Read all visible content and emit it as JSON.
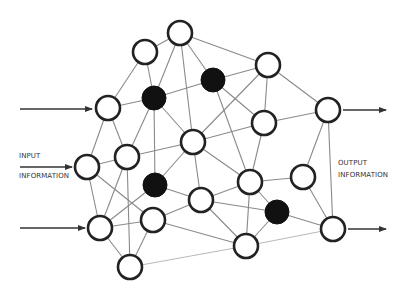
{
  "diagram": {
    "labels": {
      "input_line1": "INPUT",
      "input_line2": "INFORMATION",
      "output_line1": "OUTPUT",
      "output_line2": "INFORMATION"
    },
    "colors": {
      "node_fill_white": "#ffffff",
      "node_fill_black": "#111111",
      "node_stroke": "#222222",
      "edge": "#8a8a8a",
      "arrow": "#333333"
    },
    "nodes": [
      {
        "id": "A",
        "x": 145,
        "y": 52,
        "type": "white"
      },
      {
        "id": "B",
        "x": 180,
        "y": 33,
        "type": "white"
      },
      {
        "id": "C",
        "x": 213,
        "y": 80,
        "type": "black"
      },
      {
        "id": "D",
        "x": 268,
        "y": 65,
        "type": "white"
      },
      {
        "id": "E",
        "x": 154,
        "y": 98,
        "type": "black"
      },
      {
        "id": "F",
        "x": 108,
        "y": 108,
        "type": "white"
      },
      {
        "id": "G",
        "x": 328,
        "y": 110,
        "type": "white"
      },
      {
        "id": "H",
        "x": 193,
        "y": 142,
        "type": "white"
      },
      {
        "id": "I",
        "x": 264,
        "y": 123,
        "type": "white"
      },
      {
        "id": "J",
        "x": 127,
        "y": 157,
        "type": "white"
      },
      {
        "id": "K",
        "x": 87,
        "y": 167,
        "type": "white"
      },
      {
        "id": "L",
        "x": 155,
        "y": 185,
        "type": "black"
      },
      {
        "id": "M",
        "x": 201,
        "y": 200,
        "type": "white"
      },
      {
        "id": "N",
        "x": 250,
        "y": 182,
        "type": "white"
      },
      {
        "id": "O",
        "x": 303,
        "y": 177,
        "type": "white"
      },
      {
        "id": "P",
        "x": 100,
        "y": 228,
        "type": "white"
      },
      {
        "id": "Q",
        "x": 153,
        "y": 220,
        "type": "white"
      },
      {
        "id": "R",
        "x": 277,
        "y": 212,
        "type": "black"
      },
      {
        "id": "S",
        "x": 333,
        "y": 229,
        "type": "white"
      },
      {
        "id": "T",
        "x": 246,
        "y": 246,
        "type": "white"
      },
      {
        "id": "U",
        "x": 130,
        "y": 267,
        "type": "white"
      }
    ],
    "edges": [
      [
        "A",
        "B"
      ],
      [
        "A",
        "F"
      ],
      [
        "A",
        "E"
      ],
      [
        "B",
        "E"
      ],
      [
        "B",
        "H"
      ],
      [
        "B",
        "C"
      ],
      [
        "B",
        "D"
      ],
      [
        "C",
        "D"
      ],
      [
        "C",
        "E"
      ],
      [
        "C",
        "I"
      ],
      [
        "C",
        "N"
      ],
      [
        "D",
        "H"
      ],
      [
        "D",
        "I"
      ],
      [
        "D",
        "G"
      ],
      [
        "E",
        "F"
      ],
      [
        "E",
        "H"
      ],
      [
        "E",
        "L"
      ],
      [
        "E",
        "J"
      ],
      [
        "F",
        "K"
      ],
      [
        "F",
        "J"
      ],
      [
        "G",
        "I"
      ],
      [
        "G",
        "O"
      ],
      [
        "G",
        "S"
      ],
      [
        "H",
        "I"
      ],
      [
        "H",
        "J"
      ],
      [
        "H",
        "L"
      ],
      [
        "H",
        "M"
      ],
      [
        "H",
        "N"
      ],
      [
        "I",
        "N"
      ],
      [
        "J",
        "K"
      ],
      [
        "J",
        "P"
      ],
      [
        "J",
        "U"
      ],
      [
        "K",
        "P"
      ],
      [
        "K",
        "Q"
      ],
      [
        "L",
        "M"
      ],
      [
        "L",
        "P"
      ],
      [
        "M",
        "N"
      ],
      [
        "M",
        "R"
      ],
      [
        "M",
        "T"
      ],
      [
        "M",
        "Q"
      ],
      [
        "N",
        "O"
      ],
      [
        "N",
        "R"
      ],
      [
        "N",
        "T"
      ],
      [
        "O",
        "S"
      ],
      [
        "R",
        "T"
      ],
      [
        "R",
        "S"
      ],
      [
        "P",
        "Q"
      ],
      [
        "P",
        "U"
      ],
      [
        "Q",
        "U"
      ],
      [
        "Q",
        "T"
      ]
    ],
    "light_edges": [
      [
        "T",
        "S"
      ],
      [
        "U",
        "T"
      ]
    ],
    "arrows": [
      {
        "id": "input-arrow-top",
        "x1": 20,
        "y1": 109,
        "x2": 92,
        "y2": 109
      },
      {
        "id": "input-arrow-middle",
        "x1": 20,
        "y1": 167,
        "x2": 72,
        "y2": 167
      },
      {
        "id": "input-arrow-bottom",
        "x1": 20,
        "y1": 228,
        "x2": 85,
        "y2": 228
      },
      {
        "id": "output-arrow-top",
        "x1": 343,
        "y1": 110,
        "x2": 386,
        "y2": 110
      },
      {
        "id": "output-arrow-bottom",
        "x1": 348,
        "y1": 229,
        "x2": 386,
        "y2": 229
      }
    ],
    "node_radius": 12
  }
}
